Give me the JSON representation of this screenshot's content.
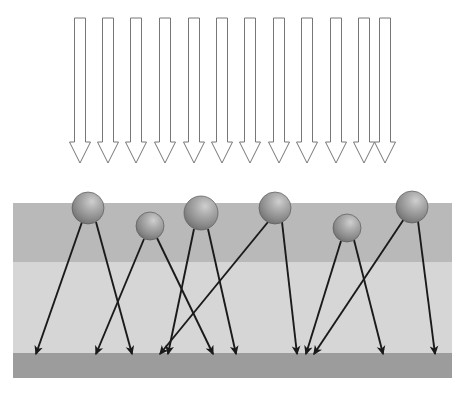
{
  "figure": {
    "width": 473,
    "height": 398,
    "background_color": "#ffffff"
  },
  "colors": {
    "background": "#ffffff",
    "incident_arrow_stroke": "#777777",
    "incident_arrow_fill": "#ffffff",
    "scatter_ray_stroke": "#1a1a1a",
    "substrate_top_layer": "#b9b9b9",
    "substrate_middle_layer": "#d6d6d6",
    "substrate_bottom_layer": "#9c9c9c",
    "sphere_light": "#c9c9c9",
    "sphere_mid": "#9e9e9e",
    "sphere_dark": "#6f6f6f",
    "sphere_edge": "#5c5c5c"
  },
  "substrate": {
    "label": "layered-substrate",
    "x": 13,
    "width": 439,
    "layers": [
      {
        "name": "top-layer",
        "y": 203,
        "height": 59,
        "color": "#b9b9b9"
      },
      {
        "name": "middle-layer",
        "y": 262,
        "height": 91,
        "color": "#d6d6d6"
      },
      {
        "name": "bottom-layer",
        "y": 353,
        "height": 25,
        "color": "#9c9c9c"
      }
    ]
  },
  "incident_beam": {
    "label": "incident-beam",
    "count": 12,
    "top_y": 18,
    "tip_y": 163,
    "shaft_half_width": 5.5,
    "head_half_width": 10.5,
    "head_height": 21,
    "centers_x": [
      80,
      108,
      136,
      165,
      194,
      222,
      250,
      279,
      307,
      336,
      364,
      385
    ]
  },
  "particles": {
    "label": "surface-particles",
    "count": 6,
    "items": [
      {
        "name": "particle-1",
        "cx": 88,
        "cy": 208,
        "r": 16
      },
      {
        "name": "particle-2",
        "cx": 150,
        "cy": 226,
        "r": 14
      },
      {
        "name": "particle-3",
        "cx": 201,
        "cy": 213,
        "r": 17
      },
      {
        "name": "particle-4",
        "cx": 275,
        "cy": 208,
        "r": 16
      },
      {
        "name": "particle-5",
        "cx": 347,
        "cy": 228,
        "r": 14
      },
      {
        "name": "particle-6",
        "cx": 412,
        "cy": 207,
        "r": 16
      }
    ]
  },
  "scattered_rays": {
    "label": "scattered-rays",
    "count": 12,
    "tip_y": 354,
    "items": [
      {
        "name": "ray-1",
        "from_particle": 1,
        "x1": 82,
        "y1": 222,
        "x2": 36,
        "y2": 354
      },
      {
        "name": "ray-2",
        "from_particle": 1,
        "x1": 96,
        "y1": 222,
        "x2": 132,
        "y2": 354
      },
      {
        "name": "ray-3",
        "from_particle": 2,
        "x1": 144,
        "y1": 239,
        "x2": 96,
        "y2": 354
      },
      {
        "name": "ray-4",
        "from_particle": 2,
        "x1": 157,
        "y1": 238,
        "x2": 213,
        "y2": 354
      },
      {
        "name": "ray-5",
        "from_particle": 3,
        "x1": 194,
        "y1": 229,
        "x2": 168,
        "y2": 354
      },
      {
        "name": "ray-6",
        "from_particle": 3,
        "x1": 208,
        "y1": 229,
        "x2": 236,
        "y2": 354
      },
      {
        "name": "ray-7",
        "from_particle": 4,
        "x1": 268,
        "y1": 222,
        "x2": 160,
        "y2": 354
      },
      {
        "name": "ray-8",
        "from_particle": 4,
        "x1": 282,
        "y1": 222,
        "x2": 297,
        "y2": 354
      },
      {
        "name": "ray-9",
        "from_particle": 5,
        "x1": 341,
        "y1": 241,
        "x2": 306,
        "y2": 354
      },
      {
        "name": "ray-10",
        "from_particle": 5,
        "x1": 354,
        "y1": 240,
        "x2": 383,
        "y2": 354
      },
      {
        "name": "ray-11",
        "from_particle": 6,
        "x1": 404,
        "y1": 219,
        "x2": 314,
        "y2": 354
      },
      {
        "name": "ray-12",
        "from_particle": 6,
        "x1": 418,
        "y1": 221,
        "x2": 435,
        "y2": 354
      }
    ]
  }
}
